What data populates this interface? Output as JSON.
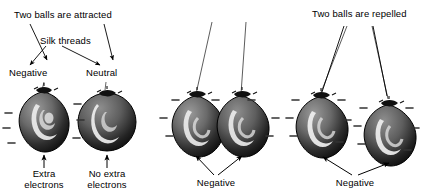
{
  "figure": {
    "background_color": "#ffffff",
    "ink_color": "#000000"
  },
  "panels": [
    {
      "id": "panel-attracted",
      "caption": "Two balls are attracted",
      "thread_label": "Silk threads",
      "balls": [
        {
          "name": "negative-ball",
          "charge_label": "Negative",
          "bottom_label": "Extra\nelectrons",
          "minus_signs": 6,
          "charged": true
        },
        {
          "name": "neutral-ball",
          "charge_label": "Neutral",
          "bottom_label": "No extra\nelectrons",
          "minus_signs": 0,
          "charged": false
        }
      ]
    },
    {
      "id": "panel-touching",
      "caption": "",
      "balls": [
        {
          "name": "negative-ball-left",
          "charge_label": "",
          "bottom_label": "Negative",
          "minus_signs": 3,
          "charged": true
        },
        {
          "name": "negative-ball-right",
          "charge_label": "",
          "bottom_label": "Negative",
          "minus_signs": 3,
          "charged": true
        }
      ],
      "shared_bottom_label": "Negative"
    },
    {
      "id": "panel-repelled",
      "caption": "Two balls are repelled",
      "balls": [
        {
          "name": "negative-ball-left",
          "charge_label": "",
          "bottom_label": "Negative",
          "minus_signs": 5,
          "charged": true
        },
        {
          "name": "negative-ball-right",
          "charge_label": "",
          "bottom_label": "Negative",
          "minus_signs": 5,
          "charged": true
        }
      ],
      "shared_bottom_label": "Negative"
    }
  ],
  "labels": {
    "attracted": "Two balls are attracted",
    "silk_threads": "Silk threads",
    "negative": "Negative",
    "neutral": "Neutral",
    "extra_electrons_l1": "Extra",
    "extra_electrons_l2": "electrons",
    "no_extra_electrons_l1": "No extra",
    "no_extra_electrons_l2": "electrons",
    "negative_mid": "Negative",
    "repelled": "Two balls are repelled",
    "negative_right": "Negative"
  },
  "colors": {
    "balloon_dark": "#1b1b1b",
    "balloon_mid": "#6e6e6e",
    "balloon_light": "#c9c9c9",
    "highlight": "#f2f2f2",
    "thread": "#4a4a4a",
    "minus": "#3a3a3a"
  }
}
